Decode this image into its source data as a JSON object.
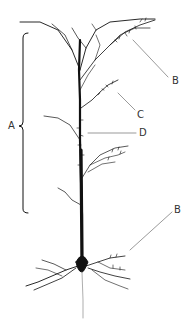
{
  "diagram": {
    "labels": {
      "A": "A",
      "B_top": "B",
      "C": "C",
      "D": "D",
      "B_bottom": "B"
    }
  }
}
